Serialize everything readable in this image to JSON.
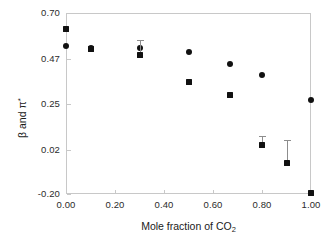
{
  "chart_data": {
    "type": "scatter",
    "title": "",
    "xlabel": "Mole fraction of CO2",
    "ylabel": "beta and pi*",
    "xlim": [
      0.0,
      1.0
    ],
    "ylim": [
      -0.2,
      0.7
    ],
    "grid": false,
    "legend": "none",
    "xticks": [
      "0.00",
      "0.20",
      "0.40",
      "0.60",
      "0.80",
      "1.00"
    ],
    "xtick_values": [
      0.0,
      0.2,
      0.4,
      0.6,
      0.8,
      1.0
    ],
    "yticks": [
      "0.70",
      "0.47",
      "0.25",
      "0.02",
      "-0.20"
    ],
    "ytick_values": [
      0.7,
      0.47,
      0.25,
      0.02,
      -0.2
    ],
    "series": [
      {
        "name": "pi*",
        "marker": "circle",
        "color": "#111111",
        "points": [
          {
            "x": 0.0,
            "y": 0.535
          },
          {
            "x": 0.1,
            "y": 0.525
          },
          {
            "x": 0.3,
            "y": 0.525
          },
          {
            "x": 0.5,
            "y": 0.505
          },
          {
            "x": 0.67,
            "y": 0.445
          },
          {
            "x": 0.8,
            "y": 0.39
          },
          {
            "x": 1.0,
            "y": 0.265
          }
        ]
      },
      {
        "name": "beta",
        "marker": "square",
        "color": "#111111",
        "points": [
          {
            "x": 0.0,
            "y": 0.62,
            "err_low": 0.0,
            "err_high": 0.0
          },
          {
            "x": 0.1,
            "y": 0.52,
            "err_low": 0.0,
            "err_high": 0.0
          },
          {
            "x": 0.3,
            "y": 0.49,
            "err_low": 0.0,
            "err_high": 0.075
          },
          {
            "x": 0.5,
            "y": 0.355,
            "err_low": 0.0,
            "err_high": 0.0
          },
          {
            "x": 0.67,
            "y": 0.29,
            "err_low": 0.0,
            "err_high": 0.0
          },
          {
            "x": 0.8,
            "y": 0.045,
            "err_low": 0.0,
            "err_high": 0.045
          },
          {
            "x": 0.9,
            "y": -0.045,
            "err_low": 0.0,
            "err_high": 0.115
          },
          {
            "x": 1.0,
            "y": -0.195,
            "err_low": 0.0,
            "err_high": 0.0
          }
        ]
      }
    ]
  },
  "axes": {
    "x_title_prefix": "Mole fraction of CO",
    "x_title_sub": "2",
    "y_title_beta": "β",
    "y_title_and": " and ",
    "y_title_pi": "π",
    "y_title_star": "*"
  }
}
